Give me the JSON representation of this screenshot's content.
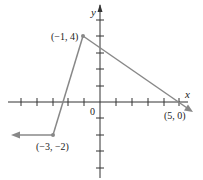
{
  "graph": {
    "x_axis_label": "x",
    "y_axis_label": "y",
    "origin_label": "0",
    "points": [
      {
        "label": "(−1, 4)",
        "x": -1,
        "y": 4
      },
      {
        "label": "(5, 0)",
        "x": 5,
        "y": 0
      },
      {
        "label": "(−3, −2)",
        "x": -3,
        "y": -2
      }
    ],
    "segments": [
      {
        "from": "left-infinity at y=-2",
        "to": "(−3, −2)"
      },
      {
        "from": "(−3, −2)",
        "to": "(−1, 4)"
      },
      {
        "from": "(−1, 4)",
        "to": "(5, 0) and beyond"
      }
    ],
    "colors": {
      "axis": "#333333",
      "curve": "#888888"
    }
  }
}
